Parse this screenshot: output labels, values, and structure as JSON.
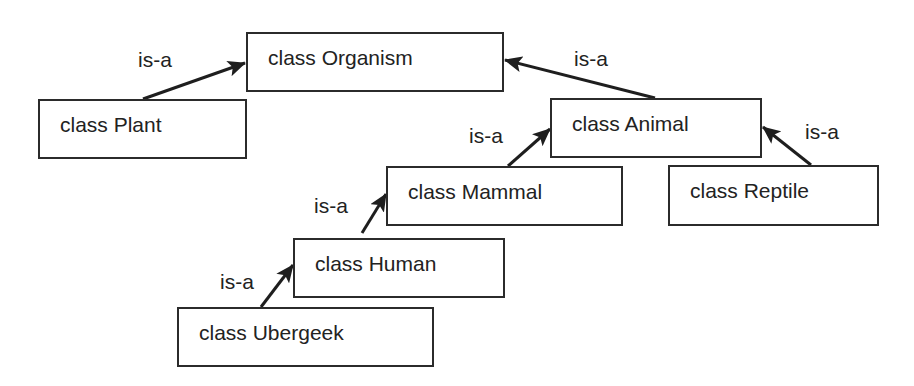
{
  "diagram": {
    "type": "class-hierarchy",
    "relation_label": "is-a",
    "classes": [
      {
        "id": "organism",
        "label": "class Organism",
        "box": [
          246,
          32,
          258,
          60
        ]
      },
      {
        "id": "plant",
        "label": "class Plant",
        "box": [
          38,
          99,
          209,
          60
        ]
      },
      {
        "id": "animal",
        "label": "class Animal",
        "box": [
          550,
          98,
          212,
          60
        ]
      },
      {
        "id": "mammal",
        "label": "class Mammal",
        "box": [
          386,
          166,
          237,
          60
        ]
      },
      {
        "id": "reptile",
        "label": "class Reptile",
        "box": [
          668,
          165,
          211,
          61
        ]
      },
      {
        "id": "human",
        "label": "class Human",
        "box": [
          293,
          238,
          212,
          60
        ]
      },
      {
        "id": "ubergeek",
        "label": "class Ubergeek",
        "box": [
          177,
          307,
          257,
          60
        ]
      }
    ],
    "edges": [
      {
        "from": "plant",
        "to": "organism",
        "label": "is-a",
        "label_pos": [
          138,
          46
        ]
      },
      {
        "from": "animal",
        "to": "organism",
        "label": "is-a",
        "label_pos": [
          575,
          46
        ]
      },
      {
        "from": "mammal",
        "to": "animal",
        "label": "is-a",
        "label_pos": [
          469,
          124
        ]
      },
      {
        "from": "reptile",
        "to": "animal",
        "label": "is-a",
        "label_pos": [
          805,
          120
        ]
      },
      {
        "from": "human",
        "to": "mammal",
        "label": "is-a",
        "label_pos": [
          314,
          193
        ]
      },
      {
        "from": "ubergeek",
        "to": "human",
        "label": "is-a",
        "label_pos": [
          220,
          270
        ]
      }
    ]
  },
  "labels": {
    "organism": "class Organism",
    "plant": "class Plant",
    "animal": "class Animal",
    "mammal": "class Mammal",
    "reptile": "class Reptile",
    "human": "class Human",
    "ubergeek": "class Ubergeek",
    "isa": "is-a"
  },
  "colors": {
    "line": "#1e1e1e",
    "border": "#2b2b2b",
    "background": "#ffffff"
  }
}
